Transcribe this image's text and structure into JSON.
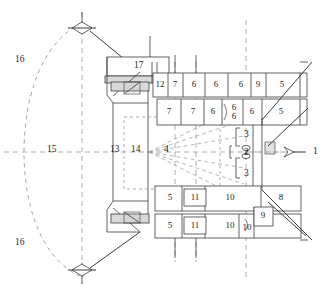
{
  "figure": {
    "background": "#ffffff",
    "line_color": "#3c3c3c",
    "dash_color": "#9a9a9a",
    "hatch_color": "#b9b9b9",
    "text_color": "#1c1c1c",
    "width": 328,
    "height": 297
  },
  "callouts": [
    {
      "id": "c1",
      "label": "1",
      "x": 313,
      "y": 152,
      "role": "right-axis-arrow-callout"
    },
    {
      "id": "c2",
      "label": "2",
      "x": 247,
      "y": 155,
      "role": "axis-node-callout"
    },
    {
      "id": "c3a",
      "label": "3",
      "x": 247,
      "y": 135,
      "role": "upper-bracket-callout"
    },
    {
      "id": "c3b",
      "label": "3",
      "x": 247,
      "y": 174,
      "role": "lower-bracket-callout"
    },
    {
      "id": "c15",
      "label": "15",
      "x": 52,
      "y": 150,
      "role": "centerline-callout"
    },
    {
      "id": "c16a",
      "label": "16",
      "x": 21,
      "y": 60,
      "role": "upper-arc-callout"
    },
    {
      "id": "c16b",
      "label": "16",
      "x": 21,
      "y": 243,
      "role": "lower-arc-callout"
    },
    {
      "id": "c13",
      "label": "13",
      "x": 115,
      "y": 150,
      "role": "left-wall-callout"
    },
    {
      "id": "c14",
      "label": "14",
      "x": 136,
      "y": 150,
      "role": "inner-region-callout"
    },
    {
      "id": "c4",
      "label": "4",
      "x": 167,
      "y": 150,
      "role": "fan-region-callout"
    },
    {
      "id": "c17",
      "label": "17",
      "x": 139,
      "y": 66,
      "role": "top-block-callout"
    }
  ],
  "upper_row_1": {
    "name": "upper chamber row one",
    "cells": [
      {
        "label": "12",
        "x": 160,
        "y": 85,
        "w": 14,
        "h": 24
      },
      {
        "label": "7",
        "x": 175,
        "y": 85,
        "w": 14,
        "h": 24
      },
      {
        "label": "6",
        "x": 194,
        "y": 85,
        "w": 22,
        "h": 24
      },
      {
        "label": "6",
        "x": 216,
        "y": 85,
        "w": 22,
        "h": 24
      },
      {
        "label": "6",
        "x": 241,
        "y": 85,
        "w": 21,
        "h": 24
      },
      {
        "label": "9",
        "x": 258,
        "y": 85,
        "w": 13,
        "h": 24
      },
      {
        "label": "5",
        "x": 277,
        "y": 85,
        "w": 22,
        "h": 24
      }
    ]
  },
  "upper_row_2": {
    "name": "upper chamber row two",
    "cells": [
      {
        "label": "7",
        "x": 169,
        "y": 112,
        "w": 26,
        "h": 26
      },
      {
        "label": "7",
        "x": 193,
        "y": 112,
        "w": 23,
        "h": 26
      },
      {
        "label": "6",
        "x": 213,
        "y": 112,
        "w": 18,
        "h": 26
      },
      {
        "label": "6\n6",
        "x": 234,
        "y": 112,
        "w": 20,
        "h": 26,
        "stacked": true
      },
      {
        "label": "6",
        "x": 252,
        "y": 112,
        "w": 16,
        "h": 26
      },
      {
        "label": "5",
        "x": 275,
        "y": 112,
        "w": 24,
        "h": 26
      }
    ]
  },
  "lower_row_1": {
    "name": "lower chamber row one",
    "cells": [
      {
        "label": "5",
        "x": 170,
        "y": 198,
        "w": 26,
        "h": 26
      },
      {
        "label": "11",
        "x": 193,
        "y": 198,
        "w": 24,
        "h": 26
      },
      {
        "label": "10",
        "x": 217,
        "y": 198,
        "w": 40,
        "h": 26
      },
      {
        "label": "8",
        "x": 277,
        "y": 198,
        "w": 30,
        "h": 26
      }
    ]
  },
  "lower_row_2": {
    "name": "lower chamber row two",
    "cells": [
      {
        "label": "5",
        "x": 170,
        "y": 226,
        "w": 26,
        "h": 24
      },
      {
        "label": "11",
        "x": 193,
        "y": 226,
        "w": 24,
        "h": 24
      },
      {
        "label": "10",
        "x": 217,
        "y": 226,
        "w": 40,
        "h": 24
      },
      {
        "label": "10",
        "x": 246,
        "y": 228,
        "w": 14,
        "h": 22
      },
      {
        "label": "9",
        "x": 262,
        "y": 216,
        "w": 18,
        "h": 20
      }
    ]
  },
  "icons": {
    "top_pivot": "pivot-hinge-icon",
    "bottom_pivot": "pivot-hinge-icon",
    "axis_node": "axis-node-icon",
    "right_arrow": "right-arrow-icon"
  }
}
